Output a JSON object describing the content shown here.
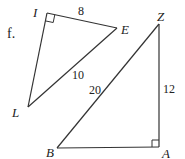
{
  "problem": {
    "label": "f."
  },
  "triangles": [
    {
      "name": "ILE",
      "vertices": [
        {
          "label": "I",
          "x": 47,
          "y": 13,
          "lx": 33,
          "ly": 17
        },
        {
          "label": "E",
          "x": 117,
          "y": 28,
          "lx": 121,
          "ly": 33
        },
        {
          "label": "L",
          "x": 28,
          "y": 107,
          "lx": 12,
          "ly": 117
        }
      ],
      "right_angle_at": "I",
      "sides": [
        {
          "between": "I-E",
          "length": "8",
          "lx": 78,
          "ly": 15
        },
        {
          "between": "L-E",
          "length": "10",
          "lx": 72,
          "ly": 79
        }
      ]
    },
    {
      "name": "ZBA",
      "vertices": [
        {
          "label": "Z",
          "x": 159,
          "y": 24,
          "lx": 157,
          "ly": 21
        },
        {
          "label": "B",
          "x": 57,
          "y": 148,
          "lx": 46,
          "ly": 157
        },
        {
          "label": "A",
          "x": 159,
          "y": 146,
          "lx": 162,
          "ly": 158
        }
      ],
      "right_angle_at": "A",
      "sides": [
        {
          "between": "B-Z",
          "length": "20",
          "lx": 89,
          "ly": 94
        },
        {
          "between": "Z-A",
          "length": "12",
          "lx": 163,
          "ly": 93
        }
      ]
    }
  ]
}
